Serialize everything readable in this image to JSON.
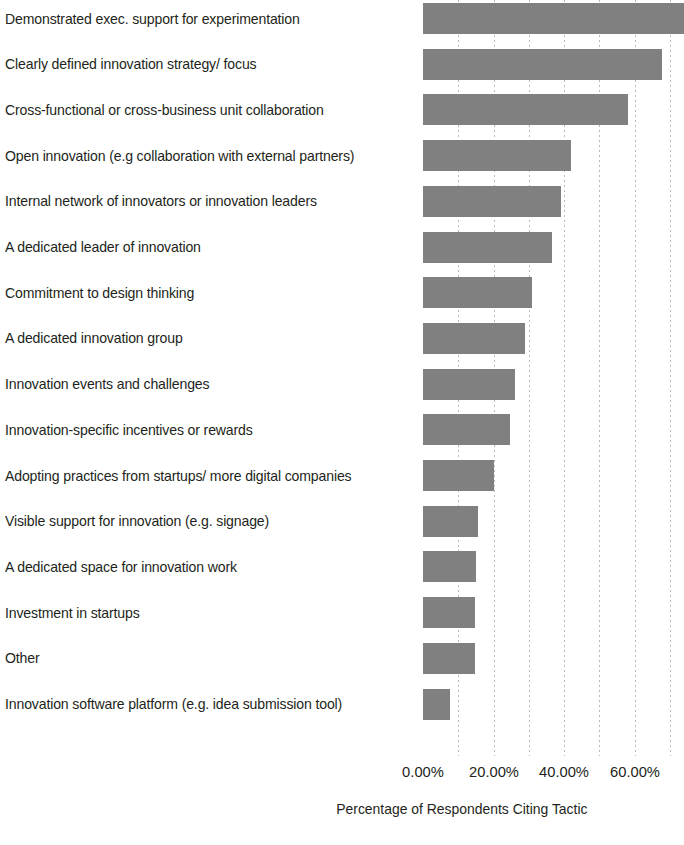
{
  "chart_data": {
    "type": "bar",
    "orientation": "horizontal",
    "title": "",
    "xlabel": "Percentage of Respondents Citing Tactic",
    "ylabel": "",
    "xlim": [
      0,
      74
    ],
    "xticks": [
      0,
      20,
      40,
      60
    ],
    "xtick_labels": [
      "0.00%",
      "20.00%",
      "40.00%",
      "60.00%"
    ],
    "grid": "vertical-dotted",
    "legend": "none",
    "bar_color": "#808080",
    "text_color": "#231f20",
    "gridline_color": "#b9b9b9",
    "categories": [
      "Demonstrated exec. support for experimentation",
      "Clearly defined innovation strategy/ focus",
      "Cross-functional or cross-business unit collaboration",
      "Open innovation (e.g collaboration with external partners)",
      "Internal network of innovators or innovation leaders",
      "A dedicated leader of innovation",
      "Commitment to design thinking",
      "A dedicated innovation group",
      "Innovation events and challenges",
      "Innovation-specific incentives or rewards",
      "Adopting practices from startups/ more digital companies",
      "Visible support for innovation (e.g. signage)",
      "A dedicated space for innovation work",
      "Investment in startups",
      "Other",
      "Innovation software platform (e.g. idea submission tool)"
    ],
    "values": [
      74.0,
      67.7,
      58.0,
      42.0,
      39.0,
      36.5,
      31.0,
      29.0,
      26.0,
      24.6,
      20.0,
      15.5,
      15.0,
      14.7,
      14.7,
      7.6
    ]
  }
}
